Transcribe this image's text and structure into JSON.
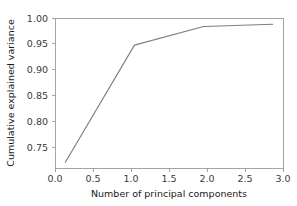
{
  "chart_data": {
    "type": "line",
    "title": "",
    "xlabel": "Number of principal components",
    "ylabel": "Cumulative explained variance",
    "x": [
      0.0,
      1.0,
      2.0,
      3.0
    ],
    "values": [
      0.723,
      0.958,
      0.9955,
      1.0
    ],
    "series": [
      {
        "name": "Cumulative explained variance",
        "values": [
          0.723,
          0.958,
          0.9955,
          1.0
        ],
        "color": "#7f7f7f"
      }
    ],
    "xlim": [
      -0.15,
      3.15
    ],
    "ylim": [
      0.7115,
      1.0125
    ],
    "xticks": [
      0.0,
      0.5,
      1.0,
      1.5,
      2.0,
      2.5,
      3.0
    ],
    "xticklabels": [
      "0.0",
      "0.5",
      "1.0",
      "1.5",
      "2.0",
      "2.5",
      "3.0"
    ],
    "yticks": [
      0.75,
      0.8,
      0.85,
      0.9,
      0.95,
      1.0
    ],
    "yticklabels": [
      "0.75",
      "0.80",
      "0.85",
      "0.90",
      "0.95",
      "1.00"
    ],
    "grid": false,
    "legend": false,
    "legend_position": "none",
    "line_color": "#7f7f7f",
    "frame_color": "#9a9a9a",
    "background_color": "#ffffff"
  },
  "axes": {
    "x_title": "Number of principal components",
    "y_title": "Cumulative explained variance",
    "x_ticks": [
      {
        "label": "0.0"
      },
      {
        "label": "0.5"
      },
      {
        "label": "1.0"
      },
      {
        "label": "1.5"
      },
      {
        "label": "2.0"
      },
      {
        "label": "2.5"
      },
      {
        "label": "3.0"
      }
    ],
    "y_ticks": [
      {
        "label": "1.00"
      },
      {
        "label": "0.95"
      },
      {
        "label": "0.90"
      },
      {
        "label": "0.85"
      },
      {
        "label": "0.80"
      },
      {
        "label": "0.75"
      }
    ]
  }
}
